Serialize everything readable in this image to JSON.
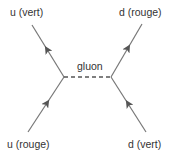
{
  "diagram": {
    "type": "feynman-diagram",
    "colors": {
      "line": "#777777",
      "arrow": "#555555",
      "text": "#333333",
      "background": "#ffffff"
    },
    "labels": {
      "top_left": "u (vert)",
      "top_right": "d (rouge)",
      "propagator": "gluon",
      "bottom_left": "u (rouge)",
      "bottom_right": "d (vert)"
    },
    "vertices": [
      {
        "id": "left-vertex",
        "x": 64,
        "y": 77
      },
      {
        "id": "right-vertex",
        "x": 111,
        "y": 77
      }
    ],
    "lines": [
      {
        "id": "u-vert-line",
        "from": [
          64,
          77
        ],
        "to": [
          32,
          25
        ],
        "style": "solid",
        "arrow": "outgoing"
      },
      {
        "id": "u-rouge-line",
        "from": [
          28,
          132
        ],
        "to": [
          64,
          77
        ],
        "style": "solid",
        "arrow": "incoming"
      },
      {
        "id": "d-rouge-line",
        "from": [
          111,
          77
        ],
        "to": [
          142,
          24
        ],
        "style": "solid",
        "arrow": "outgoing"
      },
      {
        "id": "d-vert-line",
        "from": [
          146,
          132
        ],
        "to": [
          111,
          77
        ],
        "style": "solid",
        "arrow": "incoming"
      },
      {
        "id": "gluon-line",
        "from": [
          64,
          77
        ],
        "to": [
          111,
          77
        ],
        "style": "dashed",
        "arrow": "none"
      }
    ]
  }
}
